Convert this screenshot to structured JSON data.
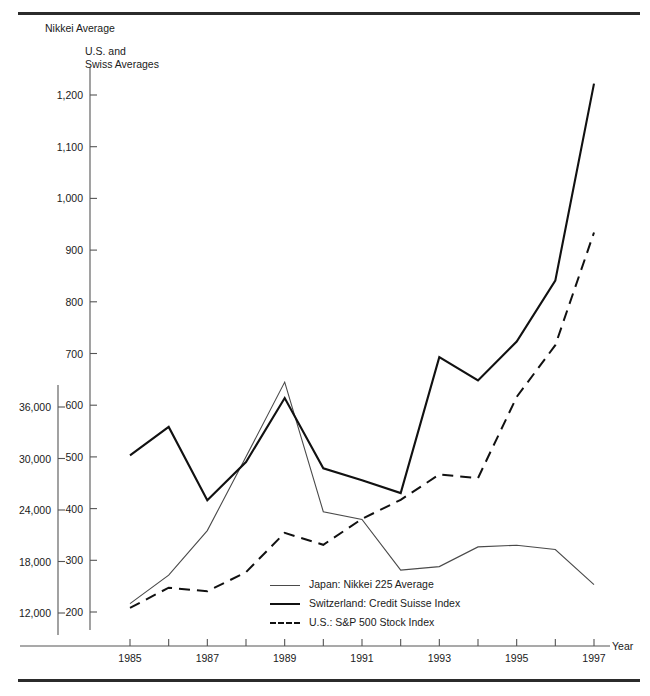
{
  "axis_titles": {
    "left": "Nikkei Average",
    "right": "U.S. and\nSwiss Averages",
    "x": "Year"
  },
  "legend": {
    "japan": "Japan: Nikkei 225 Average",
    "swiss": "Switzerland: Credit Suisse Index",
    "us": "U.S.: S&P 500 Stock Index"
  },
  "chart_data": {
    "type": "line",
    "title": "",
    "xlabel": "Year",
    "ylabel": "Nikkei Average",
    "y2label": "U.S. and Swiss Averages",
    "grid": false,
    "legend_position": "inside-bottom-center",
    "x": [
      1985,
      1986,
      1987,
      1988,
      1989,
      1990,
      1991,
      1992,
      1993,
      1994,
      1995,
      1996,
      1997
    ],
    "xticks": [
      1985,
      1986,
      1987,
      1988,
      1989,
      1990,
      1991,
      1992,
      1993,
      1994,
      1995,
      1996,
      1997
    ],
    "xtick_labels": [
      "1985",
      "",
      "1987",
      "",
      "1989",
      "",
      "1991",
      "",
      "1993",
      "",
      "1995",
      "",
      "1997"
    ],
    "xlim": [
      1985,
      1997
    ],
    "left_axis": {
      "label": "Nikkei Average",
      "ticks": [
        12000,
        18000,
        24000,
        30000,
        36000
      ],
      "tick_labels": [
        "12,000",
        "18,000",
        "24,000",
        "30,000",
        "36,000"
      ],
      "ylim": [
        12000,
        36000
      ]
    },
    "right_axis": {
      "label": "U.S. and Swiss Averages",
      "ticks": [
        200,
        300,
        400,
        500,
        600,
        700,
        800,
        900,
        1000,
        1100,
        1200
      ],
      "tick_labels": [
        "200",
        "300",
        "400",
        "500",
        "600",
        "700",
        "800",
        "900",
        "1,000",
        "1,100",
        "1,200"
      ],
      "ylim": [
        200,
        1200
      ]
    },
    "series": [
      {
        "name": "Japan: Nikkei 225 Average",
        "axis": "left",
        "style": "solid-thin",
        "values": [
          13100,
          16400,
          21600,
          30200,
          38900,
          23800,
          22900,
          17000,
          17400,
          19700,
          19900,
          19400,
          15300
        ]
      },
      {
        "name": "Switzerland: Credit Suisse Index",
        "axis": "right",
        "style": "solid-thick",
        "values": [
          503,
          558,
          416,
          490,
          614,
          478,
          455,
          430,
          693,
          648,
          723,
          841,
          1222
        ]
      },
      {
        "name": "U.S.: S&P 500 Stock Index",
        "axis": "right",
        "style": "dashed",
        "values": [
          208,
          247,
          240,
          277,
          353,
          330,
          380,
          417,
          466,
          459,
          616,
          716,
          934
        ]
      }
    ]
  }
}
